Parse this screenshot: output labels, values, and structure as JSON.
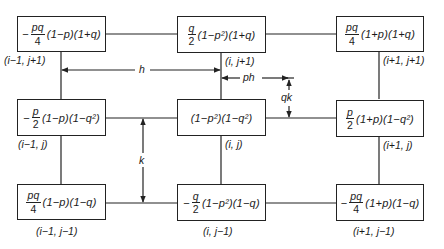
{
  "diagram": {
    "type": "finite-difference stencil weights",
    "nodes": [
      {
        "id": "n-im1-jp1",
        "sign": "−",
        "frac_num": "pq",
        "frac_den": "4",
        "factors": "(1−p)(1+q)",
        "label": "(i−1, j+1)"
      },
      {
        "id": "n-i-jp1",
        "sign": "",
        "frac_num": "q",
        "frac_den": "2",
        "factors": "(1−p²)(1+q)",
        "label": "(i, j+1)"
      },
      {
        "id": "n-ip1-jp1",
        "sign": "",
        "frac_num": "pq",
        "frac_den": "4",
        "factors": "(1+p)(1+q)",
        "label": "(i+1, j+1)"
      },
      {
        "id": "n-im1-j",
        "sign": "−",
        "frac_num": "p",
        "frac_den": "2",
        "factors": "(1−p)(1−q²)",
        "label": "(i−1, j)"
      },
      {
        "id": "n-i-j",
        "sign": "",
        "frac_num": "",
        "frac_den": "",
        "factors": "(1−p²)(1−q²)",
        "label": "(i, j)"
      },
      {
        "id": "n-ip1-j",
        "sign": "",
        "frac_num": "p",
        "frac_den": "2",
        "factors": "(1+p)(1−q²)",
        "label": "(i+1, j)"
      },
      {
        "id": "n-im1-jm1",
        "sign": "",
        "frac_num": "pq",
        "frac_den": "4",
        "factors": "(1−p)(1−q)",
        "label": "(i−1, j−1)"
      },
      {
        "id": "n-i-jm1",
        "sign": "−",
        "frac_num": "q",
        "frac_den": "2",
        "factors": "(1−p²)(1−q)",
        "label": "(i, j−1)"
      },
      {
        "id": "n-ip1-jm1",
        "sign": "−",
        "frac_num": "pq",
        "frac_den": "4",
        "factors": "(1+p)(1−q)",
        "label": "(i+1, j−1)"
      }
    ],
    "dimensions": {
      "h": "h",
      "k": "k",
      "ph": "ph",
      "qk": "qk"
    },
    "colors": {
      "line": "#222222",
      "background": "#ffffff"
    }
  }
}
